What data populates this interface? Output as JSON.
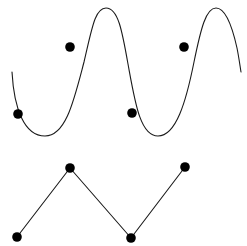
{
  "figure": {
    "title": "",
    "background_color": "#ffffff",
    "stroke_color": "#1a1a1a",
    "marker_color": "#000000",
    "width": 247,
    "height": 246
  },
  "chart_data": {
    "type": "line",
    "title": "",
    "xlabel": "",
    "ylabel": "",
    "grid": false,
    "legend": "none",
    "xlim": [
      0,
      247
    ],
    "ylim": [
      246,
      0
    ],
    "axes_visible": false,
    "tick_labels": [],
    "annotations": [],
    "series": [
      {
        "name": "smooth-sine-curve",
        "type": "line",
        "smooth": true,
        "stroke_color": "#1a1a1a",
        "stroke_width": 1.1,
        "path": "M 12 72 C 14 108, 24 136, 45 136 C 66 136, 74 100, 84 62 C 92 28, 95 8, 106 8 C 118 8, 122 30, 128 64 C 135 102, 140 136, 158 136 C 176 136, 186 102, 194 62 C 201 28, 206 8, 216 8 C 226 8, 233 30, 237 48 C 239 58, 240 66, 241 72",
        "start_point": [
          12,
          72
        ],
        "end_point": [
          241,
          72
        ],
        "crests": [
          [
            106,
            8
          ],
          [
            216,
            8
          ]
        ],
        "troughs": [
          [
            45,
            136
          ],
          [
            158,
            136
          ]
        ],
        "markers": [
          {
            "id": "curve-point-1",
            "x": 18,
            "y": 114,
            "r": 4.8
          },
          {
            "id": "curve-point-2",
            "x": 70,
            "y": 47,
            "r": 4.8
          },
          {
            "id": "curve-point-3",
            "x": 132,
            "y": 113,
            "r": 4.8
          },
          {
            "id": "curve-point-4",
            "x": 184,
            "y": 47,
            "r": 4.8
          }
        ]
      },
      {
        "name": "piecewise-linear-polyline",
        "type": "line",
        "smooth": false,
        "stroke_color": "#1a1a1a",
        "stroke_width": 1.1,
        "points": [
          [
            17,
            237
          ],
          [
            70,
            168
          ],
          [
            131,
            238
          ],
          [
            185,
            167
          ]
        ],
        "path": "M 17 237 L 70 168 L 131 238 L 185 167",
        "markers": [
          {
            "id": "polyline-vertex-1",
            "x": 17,
            "y": 237,
            "r": 4.8
          },
          {
            "id": "polyline-vertex-2",
            "x": 70,
            "y": 168,
            "r": 4.8
          },
          {
            "id": "polyline-vertex-3",
            "x": 131,
            "y": 238,
            "r": 4.8
          },
          {
            "id": "polyline-vertex-4",
            "x": 185,
            "y": 167,
            "r": 4.8
          }
        ]
      }
    ]
  }
}
